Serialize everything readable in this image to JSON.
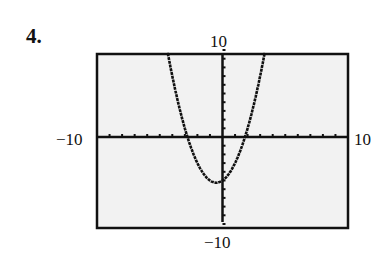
{
  "problem": {
    "number": "4."
  },
  "window": {
    "xmin_label": "−10",
    "xmax_label": "10",
    "ymin_label": "−10",
    "ymax_label": "10"
  },
  "chart_data": {
    "type": "line",
    "title": "",
    "xlabel": "",
    "ylabel": "",
    "xlim": [
      -10,
      10
    ],
    "ylim": [
      -10,
      10
    ],
    "grid": false,
    "axis_ticks": "every 1 unit",
    "tick_labels": {
      "xmin": "-10",
      "xmax": "10",
      "ymin": "-10",
      "ymax": "10"
    },
    "series": [
      {
        "name": "parabola (approx. y = x^2 + x - 5)",
        "x": [
          -4.5,
          -4,
          -3,
          -2.8,
          -2,
          -1,
          -0.5,
          0,
          1,
          1.8,
          2,
          3,
          3.3
        ],
        "y": [
          10.75,
          7,
          1,
          0,
          -3,
          -5,
          -5.25,
          -5,
          -3,
          0,
          1,
          7,
          9.2
        ]
      }
    ],
    "annotations": [],
    "background": "#f2f2f2"
  }
}
